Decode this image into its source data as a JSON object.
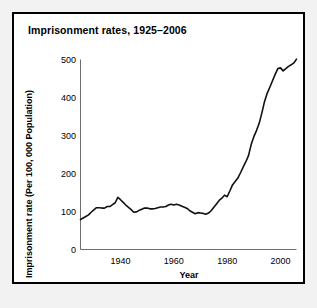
{
  "panel": {
    "background": "#ffffff",
    "border_color": "#000000"
  },
  "chart_data": {
    "type": "line",
    "title": "Imprisonment rates, 1925–2006",
    "xlabel": "Year",
    "ylabel": "Imprisonment rate (Per 100, 000 Population)",
    "xlim": [
      1925,
      2006
    ],
    "ylim": [
      0,
      500
    ],
    "xticks": [
      1940,
      1960,
      1980,
      2000
    ],
    "xtick_labels": [
      "1940",
      "1960",
      "1980",
      "2000"
    ],
    "yticks": [
      0,
      100,
      200,
      300,
      400,
      500
    ],
    "ytick_labels": [
      "0",
      "100",
      "200",
      "300",
      "400",
      "500"
    ],
    "grid": false,
    "legend": "none",
    "line_color": "#111111",
    "series": [
      {
        "name": "Imprisonment rate",
        "x": [
          1925,
          1926,
          1927,
          1928,
          1929,
          1930,
          1931,
          1932,
          1933,
          1934,
          1935,
          1936,
          1937,
          1938,
          1939,
          1940,
          1941,
          1942,
          1943,
          1944,
          1945,
          1946,
          1947,
          1948,
          1949,
          1950,
          1951,
          1952,
          1953,
          1954,
          1955,
          1956,
          1957,
          1958,
          1959,
          1960,
          1961,
          1962,
          1963,
          1964,
          1965,
          1966,
          1967,
          1968,
          1969,
          1970,
          1971,
          1972,
          1973,
          1974,
          1975,
          1976,
          1977,
          1978,
          1979,
          1980,
          1981,
          1982,
          1983,
          1984,
          1985,
          1986,
          1987,
          1988,
          1989,
          1990,
          1991,
          1992,
          1993,
          1994,
          1995,
          1996,
          1997,
          1998,
          1999,
          2000,
          2001,
          2002,
          2003,
          2004,
          2005,
          2006
        ],
        "values": [
          79,
          83,
          87,
          91,
          98,
          104,
          110,
          110,
          109,
          109,
          113,
          113,
          118,
          123,
          137,
          131,
          124,
          117,
          111,
          105,
          98,
          99,
          103,
          106,
          109,
          109,
          107,
          107,
          108,
          110,
          112,
          112,
          113,
          117,
          119,
          117,
          119,
          117,
          114,
          111,
          108,
          102,
          98,
          94,
          97,
          96,
          95,
          93,
          96,
          102,
          111,
          120,
          129,
          135,
          143,
          139,
          154,
          170,
          179,
          188,
          202,
          217,
          231,
          247,
          276,
          297,
          313,
          332,
          359,
          389,
          411,
          427,
          444,
          461,
          476,
          478,
          470,
          476,
          482,
          486,
          491,
          501
        ]
      }
    ]
  }
}
